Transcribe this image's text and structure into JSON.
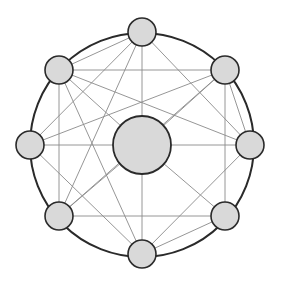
{
  "diagram": {
    "type": "network-graph",
    "canvas": {
      "width": 281,
      "height": 286,
      "background": "#ffffff"
    },
    "ring": {
      "cx": 142,
      "cy": 145,
      "r": 112
    },
    "colors": {
      "node_fill": "#d9d9d9",
      "node_stroke": "#2a2a2a",
      "edge": "#8a8a8a",
      "ring": "#2a2a2a"
    },
    "nodes": [
      {
        "id": "T",
        "x": 142,
        "y": 32,
        "r": 14
      },
      {
        "id": "TL",
        "x": 59,
        "y": 70,
        "r": 14
      },
      {
        "id": "TR",
        "x": 225,
        "y": 70,
        "r": 14
      },
      {
        "id": "L",
        "x": 30,
        "y": 145,
        "r": 14
      },
      {
        "id": "R",
        "x": 250,
        "y": 145,
        "r": 14
      },
      {
        "id": "BL",
        "x": 59,
        "y": 216,
        "r": 14
      },
      {
        "id": "BR",
        "x": 225,
        "y": 216,
        "r": 14
      },
      {
        "id": "B",
        "x": 142,
        "y": 254,
        "r": 14
      },
      {
        "id": "C",
        "x": 142,
        "y": 145,
        "r": 29,
        "hub": true
      }
    ],
    "edges": [
      [
        "T",
        "TL"
      ],
      [
        "T",
        "L"
      ],
      [
        "T",
        "BL"
      ],
      [
        "T",
        "C"
      ],
      [
        "T",
        "R"
      ],
      [
        "TL",
        "TR"
      ],
      [
        "TL",
        "BL"
      ],
      [
        "TL",
        "C"
      ],
      [
        "TL",
        "R"
      ],
      [
        "TL",
        "B"
      ],
      [
        "TR",
        "L"
      ],
      [
        "TR",
        "C"
      ],
      [
        "TR",
        "R"
      ],
      [
        "TR",
        "BR"
      ],
      [
        "TR",
        "BL"
      ],
      [
        "L",
        "C"
      ],
      [
        "L",
        "B"
      ],
      [
        "R",
        "C"
      ],
      [
        "R",
        "B"
      ],
      [
        "BL",
        "C"
      ],
      [
        "BL",
        "BR"
      ],
      [
        "BR",
        "C"
      ],
      [
        "BR",
        "B"
      ],
      [
        "C",
        "B"
      ]
    ]
  }
}
